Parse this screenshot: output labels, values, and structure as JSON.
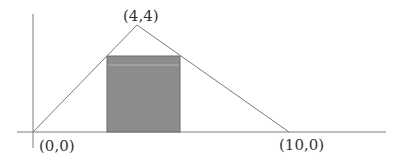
{
  "diagram": {
    "type": "geometry",
    "vertices": [
      {
        "label": "(0,0)",
        "x": 0,
        "y": 0
      },
      {
        "label": "(4,4)",
        "x": 4,
        "y": 4
      },
      {
        "label": "(10,0)",
        "x": 10,
        "y": 0
      }
    ],
    "labels": {
      "origin": "(0,0)",
      "apex": "(4,4)",
      "right_vertex": "(10,0)"
    },
    "rectangle": {
      "fill": "#8c8c8c",
      "stroke": "#6a6a6a"
    },
    "colors": {
      "line": "#7a7a7a",
      "axis": "#7a7a7a",
      "background": "#ffffff"
    }
  }
}
